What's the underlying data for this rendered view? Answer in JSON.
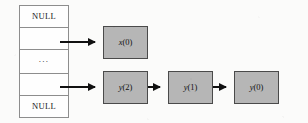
{
  "figure": {
    "background_color": "#fbfbfa",
    "node_fill_color": "#b6b6b6",
    "node_border_color": "#4a4a4a",
    "table_border_color": "#8d8d8d",
    "arrow_color": "#111111"
  },
  "list_table": {
    "name": "pointer-table",
    "cells": [
      {
        "label": "NULL",
        "kind": "null"
      },
      {
        "label": "",
        "kind": "pointer"
      },
      {
        "label": "...",
        "kind": "ellipsis"
      },
      {
        "label": "",
        "kind": "pointer"
      },
      {
        "label": "NULL",
        "kind": "null"
      }
    ]
  },
  "nodes": [
    {
      "id": "x0",
      "label": "x(0)",
      "var": "x",
      "index": "(0)",
      "row": "top"
    },
    {
      "id": "y2",
      "label": "y(2)",
      "var": "y",
      "index": "(2)",
      "row": "bottom"
    },
    {
      "id": "y1",
      "label": "y(1)",
      "var": "y",
      "index": "(1)",
      "row": "bottom"
    },
    {
      "id": "y0",
      "label": "y(0)",
      "var": "y",
      "index": "(0)",
      "row": "bottom"
    }
  ],
  "arrows": [
    {
      "id": "head-x0",
      "from": "pointer-table-row-2",
      "to": "x0"
    },
    {
      "id": "head-y2",
      "from": "pointer-table-row-4",
      "to": "y2"
    },
    {
      "id": "y2-y1",
      "from": "y2",
      "to": "y1"
    },
    {
      "id": "y1-y0",
      "from": "y1",
      "to": "y0"
    }
  ]
}
